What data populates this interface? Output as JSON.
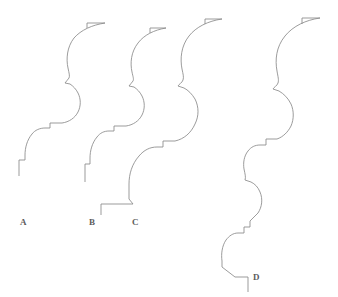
{
  "figure": {
    "type": "line-drawing",
    "background_color": "#ffffff",
    "stroke_color": "#8a8a8a",
    "label_color": "#5c5c5c",
    "width": 338,
    "height": 297
  },
  "profiles": [
    {
      "id": "A",
      "label": "A",
      "label_x": 20,
      "label_y": 218,
      "path": "M 105 23 L 87 23 L 87 28 M 105 23 C 92 25 81 30 74 38 C 67 47 66 59 68 68 C 69 73 70 76 69 78 C 68 80 66 81 65 83 L 70 84 C 73 86 76 89 78 93 C 81 99 81 106 78 112 C 75 118 69 122 62 123 L 50 123 L 50 128 L 45 128 C 40 128 35 130 32 134 C 27 140 25 148 25 155 L 25 160 L 19 160 L 19 176"
    },
    {
      "id": "B",
      "label": "B",
      "label_x": 89,
      "label_y": 218,
      "path": "M 166 28 L 150 28 L 150 33 M 166 28 C 154 30 144 35 138 43 C 131 52 130 63 132 72 C 133 77 134 79 133 81 C 132 83 130 84 129 86 L 134 87 C 137 89 140 92 142 96 C 145 102 145 109 142 115 C 139 121 133 125 126 126 L 114 126 L 114 131 L 109 131 C 104 131 100 133 97 137 C 92 143 90 151 90 158 L 90 164 L 85 164 L 85 182"
    },
    {
      "id": "C",
      "label": "C",
      "label_x": 132,
      "label_y": 218,
      "path": "M 222 19 L 205 19 L 205 24 M 222 19 C 208 21 196 27 189 36 C 181 46 180 59 182 69 C 183 74 184 77 183 80 C 182 83 179 84 178 86 L 184 88 C 188 90 192 94 195 99 C 199 107 199 116 195 124 C 191 133 184 139 175 141 L 163 141 L 163 147 L 157 147 C 150 147 144 150 139 156 C 132 164 129 174 129 184 L 129 199 L 133 204 L 101 204 L 101 215"
    },
    {
      "id": "D",
      "label": "D",
      "label_x": 253,
      "label_y": 273,
      "path": "M 320 18 L 302 18 L 302 24 M 320 18 C 306 20 293 26 285 36 C 276 47 275 60 277 71 C 278 77 279 80 278 83 C 277 86 274 87 273 89 L 279 91 C 284 94 288 98 291 104 C 294 111 294 119 291 126 C 288 132 283 137 277 139 L 266 139 L 266 145 L 260 145 C 255 145 251 147 248 151 C 244 156 243 163 244 169 C 245 174 246 177 245 180 L 251 182 C 255 184 258 187 260 192 C 263 199 262 207 258 213 L 250 221 L 250 227 L 244 227 L 244 233 L 238 233 C 233 233 229 236 226 240 C 222 246 221 254 222 261 L 222 267 L 235 277 L 248 277 L 248 292"
    }
  ]
}
